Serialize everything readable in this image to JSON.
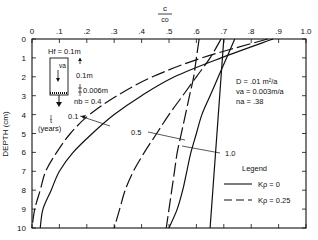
{
  "chart_data": {
    "type": "line",
    "title": "",
    "xlabel": "c / c0",
    "xlabel_num": "c",
    "xlabel_den": "c₀",
    "ylabel": "DEPTH (cm)",
    "xlim": [
      0,
      1.0
    ],
    "ylim": [
      0,
      10
    ],
    "y_inverted": true,
    "x_axis_position": "top",
    "x_ticks": [
      "0",
      ".1",
      ".2",
      ".3",
      ".4",
      ".5",
      ".6",
      ".7",
      ".8",
      ".9",
      "1.0"
    ],
    "y_ticks": [
      "0",
      "1",
      "2",
      "3",
      "4",
      "5",
      "6",
      "7",
      "8",
      "9",
      "10"
    ],
    "grid": false,
    "depth": [
      0,
      1,
      2,
      3,
      4,
      5,
      6,
      7,
      8,
      9,
      10
    ],
    "series": [
      {
        "name": "t=0.1, Kp=0",
        "time_years": 0.1,
        "Kp": 0,
        "style": "solid",
        "values": [
          0.88,
          0.69,
          0.52,
          0.4,
          0.3,
          0.22,
          0.15,
          0.1,
          0.07,
          0.04,
          0.03
        ]
      },
      {
        "name": "t=0.1, Kp=0.25",
        "time_years": 0.1,
        "Kp": 0.25,
        "style": "dashed",
        "values": [
          0.86,
          0.62,
          0.44,
          0.31,
          0.21,
          0.14,
          0.09,
          0.05,
          0.03,
          0.01,
          0.0
        ]
      },
      {
        "name": "t=0.5, Kp=0",
        "time_years": 0.5,
        "Kp": 0,
        "style": "solid",
        "values": [
          0.74,
          0.71,
          0.68,
          0.65,
          0.62,
          0.6,
          0.58,
          0.565,
          0.55,
          0.53,
          0.5
        ]
      },
      {
        "name": "t=0.5, Kp=0.25",
        "time_years": 0.5,
        "Kp": 0.25,
        "style": "dashed",
        "values": [
          0.69,
          0.65,
          0.6,
          0.55,
          0.5,
          0.455,
          0.41,
          0.37,
          0.34,
          0.32,
          0.3
        ]
      },
      {
        "name": "t=1.0, Kp=0",
        "time_years": 1.0,
        "Kp": 0,
        "style": "solid",
        "values": [
          0.7,
          0.695,
          0.69,
          0.685,
          0.68,
          0.675,
          0.67,
          0.665,
          0.66,
          0.655,
          0.65
        ]
      },
      {
        "name": "t=1.0, Kp=0.25",
        "time_years": 1.0,
        "Kp": 0.25,
        "style": "dashed",
        "values": [
          0.61,
          0.6,
          0.59,
          0.575,
          0.56,
          0.545,
          0.53,
          0.52,
          0.51,
          0.5,
          0.49
        ]
      }
    ],
    "annotations": {
      "curve_labels": [
        {
          "text": "0.1",
          "x": 0.18,
          "y": 4.3
        },
        {
          "text": "0.5",
          "x": 0.44,
          "y": 5.4
        },
        {
          "text": "1.0",
          "x": 0.8,
          "y": 6.3
        }
      ],
      "time_label": "t",
      "time_unit": "(years)",
      "schematic": {
        "Hf": "Hf = 0.1m",
        "va": "vₐ",
        "height": "0.1m",
        "base": "0.006m",
        "nb": "nᵦ = 0.4"
      },
      "parameters": [
        "D = .01 m²/a",
        "vₐ = 0.003m/a",
        "nₐ = .38"
      ]
    },
    "legend": {
      "title": "Legend",
      "position": "lower right",
      "entries": [
        {
          "label": "Kρ = 0",
          "style": "solid"
        },
        {
          "label": "Kρ = 0.25",
          "style": "dashed"
        }
      ]
    }
  },
  "text": {
    "x_num": "c",
    "x_den": "co",
    "y_label": "DEPTH (cm)",
    "hf": "Hf = 0.1m",
    "va": "va",
    "h01": "0.1m",
    "base": "0.006m",
    "nb": "nb = 0.4",
    "t_label": "t",
    "t_unit": "(years)",
    "lbl_01": "0.1",
    "lbl_05": "0.5",
    "lbl_10": "1.0",
    "param_d": "D = .01 m²/a",
    "param_va": "va = 0.003m/a",
    "param_na": "na = .38",
    "legend_title": "Legend",
    "legend_solid": "Kρ = 0",
    "legend_dashed": "Kρ = 0.25"
  }
}
